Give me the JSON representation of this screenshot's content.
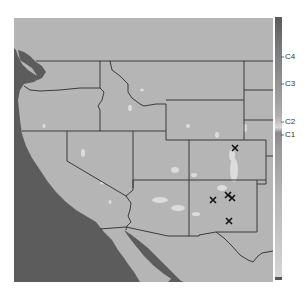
{
  "map": {
    "region": "Western United States",
    "land_color": "#b4b4b4",
    "water_color": "#5a5a5a",
    "border_color": "#3a3a3a",
    "marker_symbol": "X",
    "markers": [
      {
        "x": 235,
        "y": 148
      },
      {
        "x": 213,
        "y": 200
      },
      {
        "x": 228,
        "y": 195
      },
      {
        "x": 232,
        "y": 198
      },
      {
        "x": 229,
        "y": 221
      }
    ]
  },
  "colorbar": {
    "labels": [
      {
        "text": "C4",
        "y": 57
      },
      {
        "text": "C3",
        "y": 84
      },
      {
        "text": "C2",
        "y": 122
      },
      {
        "text": "C1",
        "y": 135
      }
    ]
  }
}
